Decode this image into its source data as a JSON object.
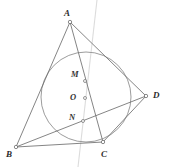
{
  "figure": {
    "width": 169,
    "height": 167,
    "background_color": "#ffffff",
    "stroke_color": "#6b6b6b",
    "faint_stroke_color": "#d8d8d8",
    "label_color": "#2b2b2b",
    "marker_fill": "#ffffff"
  },
  "points": [
    {
      "id": "A",
      "label": "A",
      "x": 70,
      "y": 22,
      "label_x": 64,
      "label_y": 9,
      "kind": "vertex"
    },
    {
      "id": "B",
      "label": "B",
      "x": 16,
      "y": 147,
      "label_x": 6,
      "label_y": 150,
      "kind": "vertex"
    },
    {
      "id": "C",
      "label": "C",
      "x": 103,
      "y": 142,
      "label_x": 101,
      "label_y": 150,
      "kind": "vertex"
    },
    {
      "id": "D",
      "label": "D",
      "x": 146,
      "y": 96,
      "label_x": 153,
      "label_y": 91,
      "kind": "vertex"
    },
    {
      "id": "M",
      "label": "M",
      "x": 85,
      "y": 81,
      "label_x": 71,
      "label_y": 70,
      "kind": "interior"
    },
    {
      "id": "O",
      "label": "O",
      "x": 85,
      "y": 98,
      "label_x": 70,
      "label_y": 93,
      "kind": "center"
    },
    {
      "id": "N",
      "label": "N",
      "x": 83,
      "y": 121,
      "label_x": 69,
      "label_y": 113,
      "kind": "interior"
    }
  ],
  "circle": {
    "id": "incircle",
    "center_x": 86,
    "center_y": 97,
    "radius": 45,
    "label": "inscribed circle"
  },
  "segments": [
    {
      "id": "AB",
      "from": "A",
      "to": "B",
      "label": "segment A to B",
      "style": "solid"
    },
    {
      "id": "AC",
      "from": "A",
      "to": "C",
      "label": "segment A to C",
      "style": "solid"
    },
    {
      "id": "BC",
      "from": "B",
      "to": "C",
      "label": "segment B to C",
      "style": "solid"
    },
    {
      "id": "AD",
      "from": "A",
      "to": "D",
      "label": "segment A to D",
      "style": "solid"
    },
    {
      "id": "BD",
      "from": "B",
      "to": "D",
      "label": "segment B to D",
      "style": "solid"
    },
    {
      "id": "CD",
      "from": "C",
      "to": "D",
      "label": "segment C to D",
      "style": "solid"
    }
  ],
  "construction_line": {
    "id": "vertical-guide",
    "label": "faint vertical construction line",
    "x1": 97,
    "y1": 0,
    "x2": 78,
    "y2": 167,
    "style": "faint"
  }
}
